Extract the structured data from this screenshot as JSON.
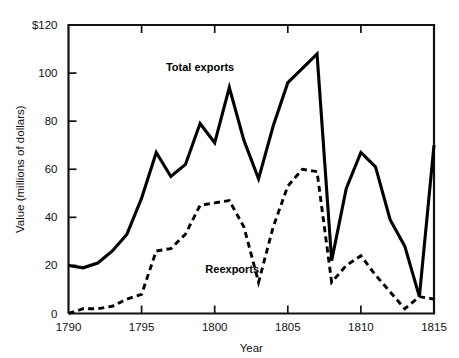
{
  "chart_data": {
    "type": "line",
    "title": "",
    "xlabel": "Year",
    "ylabel": "Value (millions of dollars)",
    "xlim": [
      1790,
      1815
    ],
    "ylim": [
      0,
      120
    ],
    "grid": false,
    "legend_position": "inline-annotations",
    "x_ticks": [
      1790,
      1795,
      1800,
      1805,
      1810,
      1815
    ],
    "x_tick_labels": [
      "1790",
      "1795",
      "1800",
      "1805",
      "1810",
      "1815"
    ],
    "y_ticks": [
      0,
      20,
      40,
      60,
      80,
      100,
      120
    ],
    "y_tick_labels": [
      "0",
      "20",
      "40",
      "60",
      "80",
      "100",
      "$120"
    ],
    "x": [
      1790,
      1791,
      1792,
      1793,
      1794,
      1795,
      1796,
      1797,
      1798,
      1799,
      1800,
      1801,
      1802,
      1803,
      1804,
      1805,
      1806,
      1807,
      1808,
      1809,
      1810,
      1811,
      1812,
      1813,
      1814,
      1815
    ],
    "series": [
      {
        "name": "Total exports",
        "style": "solid",
        "label_x": 1799,
        "label_y": 101,
        "values": [
          20,
          19,
          21,
          26,
          33,
          48,
          67,
          57,
          62,
          79,
          71,
          94,
          72,
          56,
          78,
          96,
          102,
          108,
          22,
          52,
          67,
          61,
          39,
          28,
          7,
          70
        ]
      },
      {
        "name": "Reexports",
        "style": "dashed",
        "label_x": 1801.2,
        "label_y": 17,
        "values": [
          0,
          2,
          2,
          3,
          6,
          8,
          26,
          27,
          33,
          45,
          46,
          47,
          36,
          13,
          36,
          53,
          60,
          59,
          13,
          20,
          24,
          16,
          9,
          2,
          7,
          6
        ]
      }
    ]
  },
  "colors": {
    "ink": "#000000",
    "axis": "#111111",
    "background": "#ffffff"
  }
}
